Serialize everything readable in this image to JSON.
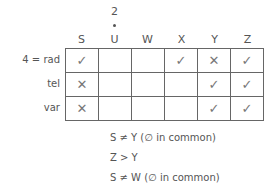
{
  "columns": [
    "S",
    "U",
    "W",
    "X",
    "Y",
    "Z"
  ],
  "column_annotation": {
    "column": "U",
    "value": "2"
  },
  "rows": [
    {
      "label": "4 = rad",
      "cells": [
        "✓",
        "",
        "",
        "✓",
        "✕",
        "✓"
      ]
    },
    {
      "label": "tel",
      "cells": [
        "✕",
        "",
        "",
        "",
        "✓",
        "✓"
      ]
    },
    {
      "label": "var",
      "cells": [
        "✕",
        "",
        "",
        "",
        "✓",
        "✓"
      ]
    }
  ],
  "notes": [
    "S ≠ Y (∅ in common)",
    "Z > Y",
    "S ≠ W (∅ in common)"
  ]
}
